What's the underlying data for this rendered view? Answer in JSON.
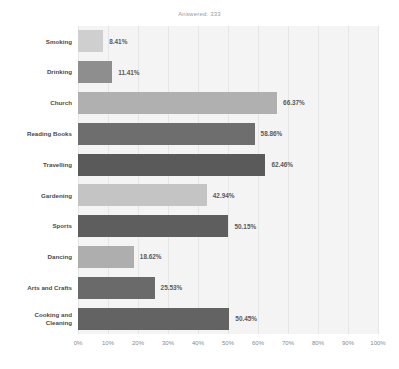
{
  "chart_data": {
    "type": "bar",
    "orientation": "horizontal",
    "title": "Answered: 333",
    "xlabel": "",
    "ylabel": "",
    "xlim": [
      0,
      100
    ],
    "grid": true,
    "legend": "none",
    "tick_labels": [
      "0%",
      "10%",
      "20%",
      "30%",
      "40%",
      "50%",
      "60%",
      "70%",
      "80%",
      "90%",
      "100%"
    ],
    "tick_values": [
      0,
      10,
      20,
      30,
      40,
      50,
      60,
      70,
      80,
      90,
      100
    ],
    "categories": [
      "Smoking",
      "Drinking",
      "Church",
      "Reading Books",
      "Travelling",
      "Gardening",
      "Sports",
      "Dancing",
      "Arts and Crafts",
      "Cooking and Cleaning"
    ],
    "values": [
      8.41,
      11.41,
      66.37,
      58.86,
      62.46,
      42.94,
      50.15,
      18.62,
      25.53,
      50.45
    ],
    "value_labels": [
      "8.41%",
      "11.41%",
      "66.37%",
      "58.86%",
      "62.46%",
      "42.94%",
      "50.15%",
      "18.62%",
      "25.53%",
      "50.45%"
    ],
    "bar_colors": [
      "#cfcfcf",
      "#8e8e8e",
      "#b0b0b0",
      "#6e6e6e",
      "#5a5a5a",
      "#c4c4c4",
      "#5e5e5e",
      "#aeaeae",
      "#6a6a6a",
      "#636363"
    ],
    "plot_background": "#f4f4f4",
    "gridline_color": "#e6e6e6",
    "label_color": "#4a4a4a",
    "value_label_color": "#5a5a5a",
    "tick_color": "#8a8a8a",
    "title_color": "#9a9a9a"
  }
}
